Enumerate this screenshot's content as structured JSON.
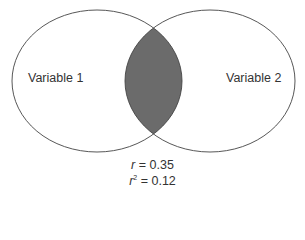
{
  "diagram": {
    "type": "venn",
    "circles": [
      {
        "label": "Variable 1",
        "cx": 97,
        "cy": 81,
        "rx": 85,
        "ry": 71
      },
      {
        "label": "Variable 2",
        "cx": 210,
        "cy": 81,
        "rx": 85,
        "ry": 71
      }
    ],
    "overlap_fill": "#6b6b6b",
    "stroke": "#444444",
    "stats": {
      "r_symbol": "r",
      "r_value": "= 0.35",
      "r2_symbol": "r",
      "r2_exp": "2",
      "r2_value": "= 0.12"
    }
  }
}
